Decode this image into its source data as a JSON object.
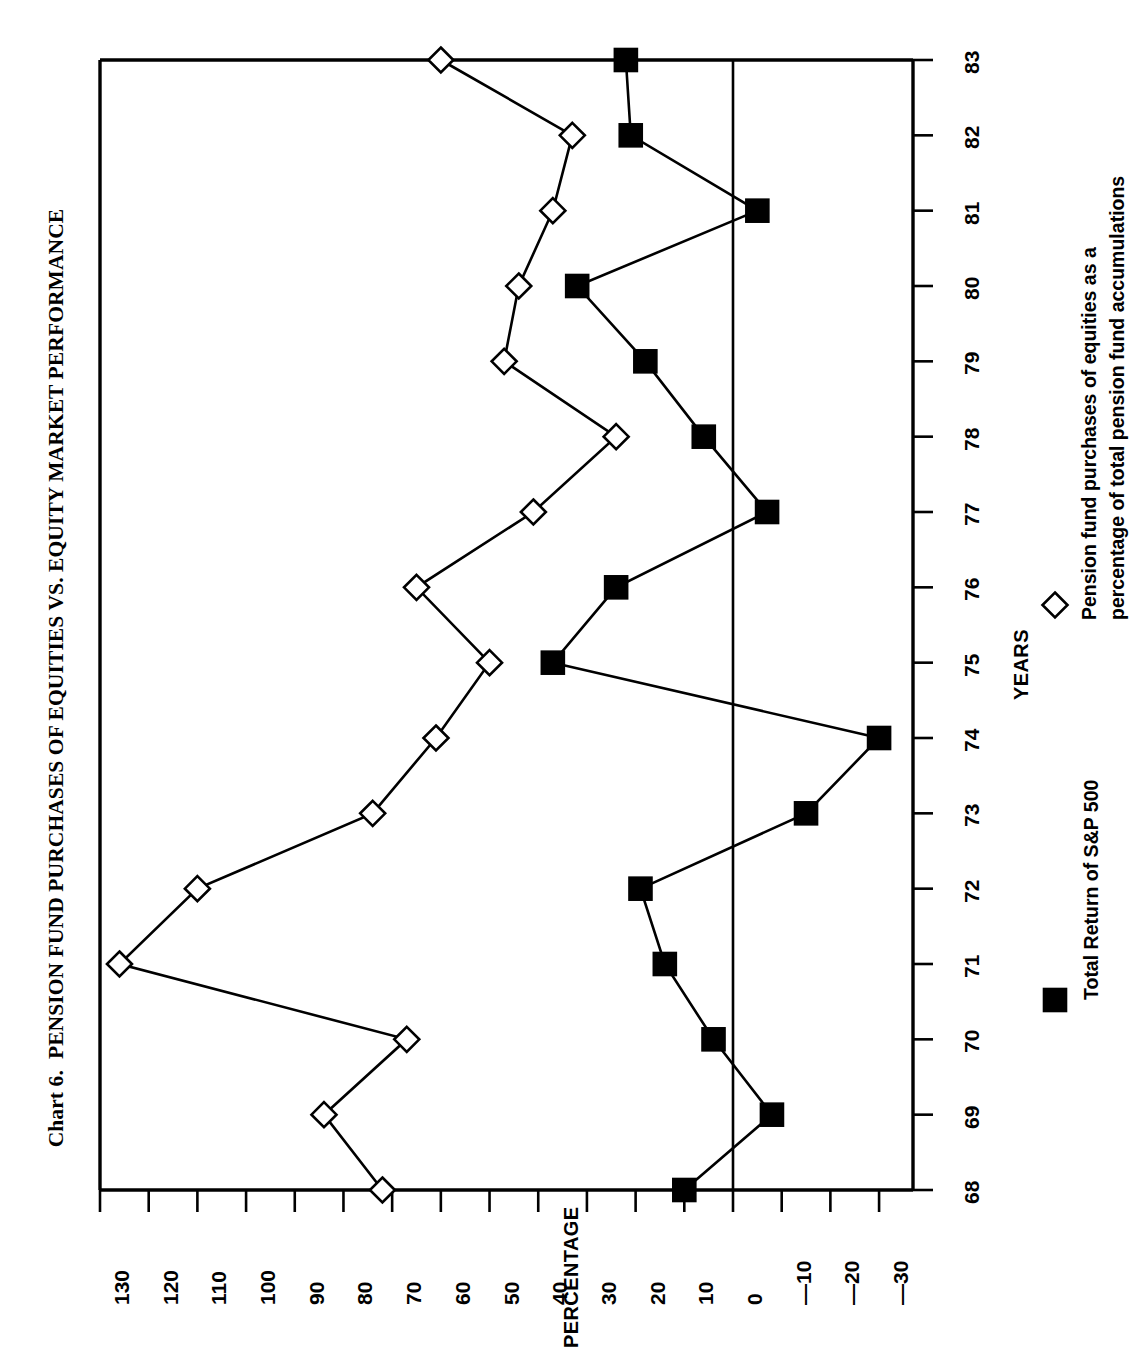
{
  "title": {
    "number": "Chart 6.",
    "main": "PENSION FUND PURCHASES OF EQUITIES VS. EQUITY MARKET PERFORMANCE"
  },
  "axes": {
    "x_title": "YEARS",
    "y_title": "PERCENTAGE",
    "x_ticks": [
      "68",
      "69",
      "70",
      "71",
      "72",
      "73",
      "74",
      "75",
      "76",
      "77",
      "78",
      "79",
      "80",
      "81",
      "82",
      "83"
    ],
    "y_ticks": [
      "130",
      "120",
      "110",
      "100",
      "90",
      "80",
      "70",
      "60",
      "50",
      "40",
      "30",
      "20",
      "10",
      "0",
      "—10",
      "—20",
      "—30"
    ]
  },
  "legend": {
    "items": [
      {
        "marker": "filled-square",
        "label": "Total Return of S&P 500"
      },
      {
        "marker": "open-diamond",
        "label_line1": "Pension fund purchases of equities as a",
        "label_line2": "percentage of total pension fund accumulations"
      }
    ]
  },
  "colors": {
    "ink": "#000000",
    "background": "#ffffff",
    "marker_fill_series1": "#000000",
    "marker_fill_series2": "#ffffff"
  },
  "chart_data": {
    "type": "line",
    "title": "Chart 6. PENSION FUND PURCHASES OF EQUITIES VS. EQUITY MARKET PERFORMANCE",
    "orientation": "rotated-90-counterclockwise",
    "xlabel": "YEARS",
    "ylabel": "PERCENTAGE",
    "grid": false,
    "legend_position": "right",
    "categories": [
      "68",
      "69",
      "70",
      "71",
      "72",
      "73",
      "74",
      "75",
      "76",
      "77",
      "78",
      "79",
      "80",
      "81",
      "82",
      "83"
    ],
    "x": [
      1968,
      1969,
      1970,
      1971,
      1972,
      1973,
      1974,
      1975,
      1976,
      1977,
      1978,
      1979,
      1980,
      1981,
      1982,
      1983
    ],
    "xlim": [
      1968,
      1983
    ],
    "ylim": [
      -30,
      130
    ],
    "yticks": [
      130,
      120,
      110,
      100,
      90,
      80,
      70,
      60,
      50,
      40,
      30,
      20,
      10,
      0,
      -10,
      -20,
      -30
    ],
    "series": [
      {
        "name": "Total Return of S&P 500",
        "marker": "filled-square",
        "values": [
          10,
          -8,
          4,
          14,
          19,
          -15,
          -30,
          37,
          24,
          -7,
          6,
          18,
          32,
          -5,
          21,
          22
        ]
      },
      {
        "name": "Pension fund purchases of equities as a percentage of total pension fund accumulations",
        "marker": "open-diamond",
        "values": [
          72,
          84,
          67,
          126,
          110,
          74,
          61,
          50,
          65,
          41,
          24,
          47,
          44,
          37,
          33,
          60
        ]
      }
    ]
  }
}
